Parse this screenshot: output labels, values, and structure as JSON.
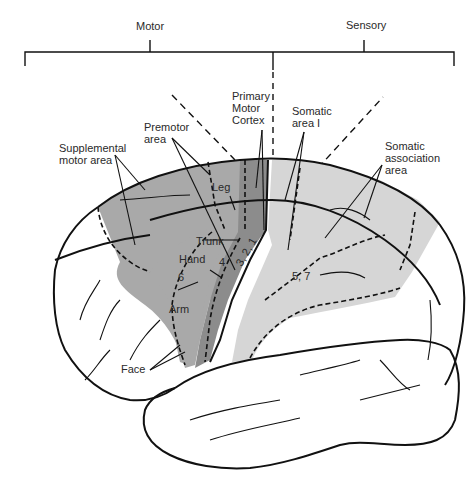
{
  "header": {
    "left_group": "Motor",
    "right_group": "Sensory"
  },
  "areas": {
    "supplemental_motor": "Supplemental\nmotor area",
    "premotor": "Premotor\narea",
    "primary_motor": "Primary\nMotor\nCortex",
    "somatic_area_1": "Somatic\narea I",
    "somatic_association": "Somatic\nassociation\narea"
  },
  "body_map": {
    "leg": "Leg",
    "trunk": "Trunk",
    "hand": "Hand",
    "arm": "Arm",
    "face": "Face"
  },
  "brodmann": {
    "area_6": "6",
    "area_4": "4",
    "areas_3_2_1": "3, 2, 1",
    "areas_5_7": "5, 7"
  },
  "colors": {
    "premotor_fill": "#a9a9a9",
    "primary_motor_fill": "#8c8c8c",
    "sensory_fill": "#d6d6d6",
    "outline": "#111111",
    "background": "#ffffff"
  }
}
